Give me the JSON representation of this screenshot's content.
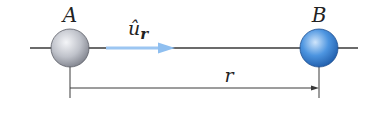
{
  "diagram": {
    "points": [
      {
        "id": "A",
        "label": "A",
        "cx": 70,
        "cy": 48,
        "r": 19,
        "color": "#b8bcc6"
      },
      {
        "id": "B",
        "label": "B",
        "cx": 319,
        "cy": 48,
        "r": 19,
        "color": "#3d86d6"
      }
    ],
    "unit_vector": {
      "label_main": "û",
      "label_sub": "r",
      "color": "#8fbff0"
    },
    "distance": {
      "label": "r"
    },
    "colors": {
      "line": "#333333",
      "sphere_a": "#b8bcc6",
      "sphere_b": "#3d86d6",
      "arrow": "#8fbff0"
    }
  }
}
